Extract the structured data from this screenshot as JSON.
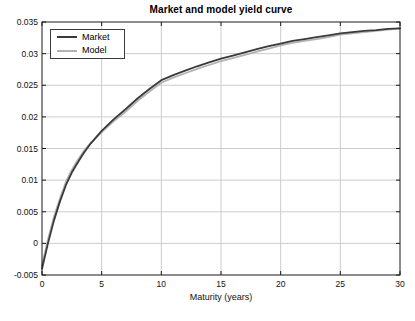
{
  "figure": {
    "background": "#ffffff"
  },
  "chart_data": {
    "type": "line",
    "title": "Market and model yield curve",
    "xlabel": "Maturity (years)",
    "ylabel": "",
    "xlim": [
      0,
      30
    ],
    "ylim": [
      -0.005,
      0.035
    ],
    "x_ticks": [
      0,
      5,
      10,
      15,
      20,
      25,
      30
    ],
    "x_tick_labels": [
      "0",
      "5",
      "10",
      "15",
      "20",
      "25",
      "30"
    ],
    "y_ticks": [
      -0.005,
      0,
      0.005,
      0.01,
      0.015,
      0.02,
      0.025,
      0.03,
      0.035
    ],
    "y_tick_labels": [
      "-0.005",
      "0",
      "0.005",
      "0.01",
      "0.015",
      "0.02",
      "0.025",
      "0.03",
      "0.035"
    ],
    "grid": true,
    "legend_position": "top-left",
    "grid_color": "#cccccc",
    "axis_color": "#1a1a1a",
    "x": [
      0,
      0.5,
      1,
      1.5,
      2,
      2.5,
      3,
      3.5,
      4,
      5,
      6,
      7,
      8,
      9,
      10,
      11,
      12,
      13,
      14,
      15,
      16,
      17,
      18,
      19,
      20,
      21,
      22,
      23,
      24,
      25,
      26,
      27,
      28,
      29,
      30
    ],
    "series": [
      {
        "name": "Market",
        "color": "#3a3a3a",
        "values": [
          -0.004,
          0.0,
          0.0036,
          0.0066,
          0.0092,
          0.0112,
          0.0128,
          0.0143,
          0.0156,
          0.0178,
          0.0196,
          0.0212,
          0.0229,
          0.0244,
          0.0258,
          0.0266,
          0.0273,
          0.028,
          0.0286,
          0.0292,
          0.0297,
          0.0302,
          0.0307,
          0.0312,
          0.0316,
          0.032,
          0.0323,
          0.0326,
          0.0329,
          0.0332,
          0.0334,
          0.0336,
          0.0337,
          0.0339,
          0.034
        ]
      },
      {
        "name": "Model",
        "color": "#b2b2b2",
        "values": [
          -0.0035,
          0.0006,
          0.0042,
          0.0071,
          0.0097,
          0.0116,
          0.0132,
          0.0146,
          0.0157,
          0.0176,
          0.0193,
          0.0208,
          0.0225,
          0.024,
          0.0254,
          0.0262,
          0.0269,
          0.0276,
          0.0282,
          0.0288,
          0.0293,
          0.0298,
          0.0303,
          0.0308,
          0.0313,
          0.0317,
          0.032,
          0.0323,
          0.0326,
          0.033,
          0.0332,
          0.0334,
          0.0336,
          0.0338,
          0.034
        ]
      }
    ]
  }
}
